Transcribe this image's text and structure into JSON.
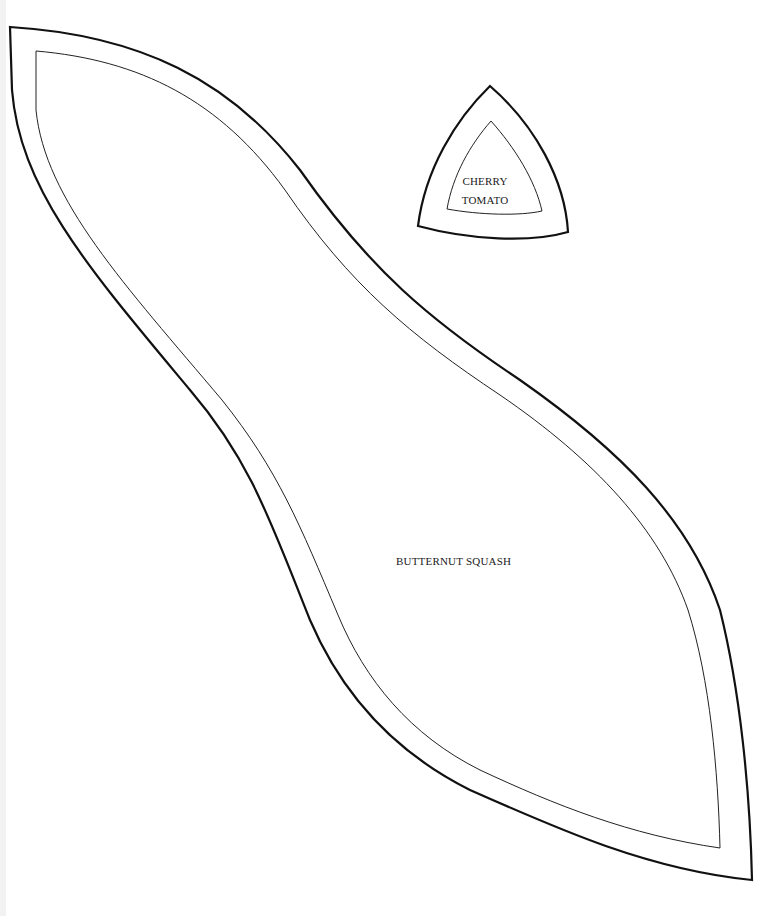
{
  "page": {
    "background": "#ffffff",
    "stroke_color": "#111111"
  },
  "shapes": [
    {
      "id": "butternut-squash",
      "label": "BUTTERNUT SQUASH",
      "outline": "thick outer cutting line",
      "inner_outline": "thin inner line"
    },
    {
      "id": "cherry-tomato",
      "label_line1": "CHERRY",
      "label_line2": "TOMATO",
      "outline": "thick outer cutting line",
      "inner_outline": "thin inner line"
    }
  ]
}
